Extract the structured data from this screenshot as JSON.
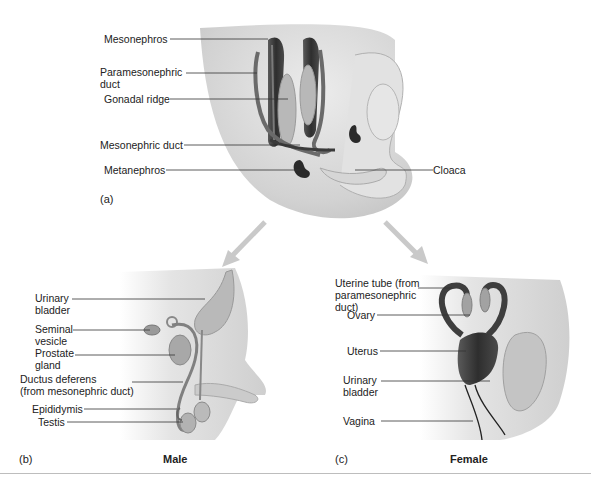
{
  "figure": {
    "panels": [
      {
        "id": "a",
        "letter": "(a)",
        "labels": {
          "mesonephros": "Mesonephros",
          "paramesonephric_duct": "Paramesonephric\nduct",
          "gonadal_ridge": "Gonadal ridge",
          "mesonephric_duct": "Mesonephric duct",
          "metanephros": "Metanephros",
          "cloaca": "Cloaca"
        }
      },
      {
        "id": "b",
        "letter": "(b)",
        "title": "Male",
        "labels": {
          "urinary_bladder": "Urinary\nbladder",
          "seminal_vesicle": "Seminal\nvesicle",
          "prostate_gland": "Prostate\ngland",
          "ductus_deferens": "Ductus deferens\n(from mesonephric duct)",
          "epididymis": "Epididymis",
          "testis": "Testis"
        }
      },
      {
        "id": "c",
        "letter": "(c)",
        "title": "Female",
        "labels": {
          "uterine_tube": "Uterine tube (from\nparamesonephric\nduct)",
          "ovary": "Ovary",
          "uterus": "Uterus",
          "urinary_bladder": "Urinary\nbladder",
          "vagina": "Vagina"
        }
      }
    ],
    "colors": {
      "tissue_light": "#d9d9d9",
      "tissue_mid": "#bdbdbd",
      "organ_dark": "#3a3a3a",
      "organ_mid": "#8a8a8a",
      "leader_line": "#333333",
      "arrow": "#c8c8c8"
    }
  }
}
